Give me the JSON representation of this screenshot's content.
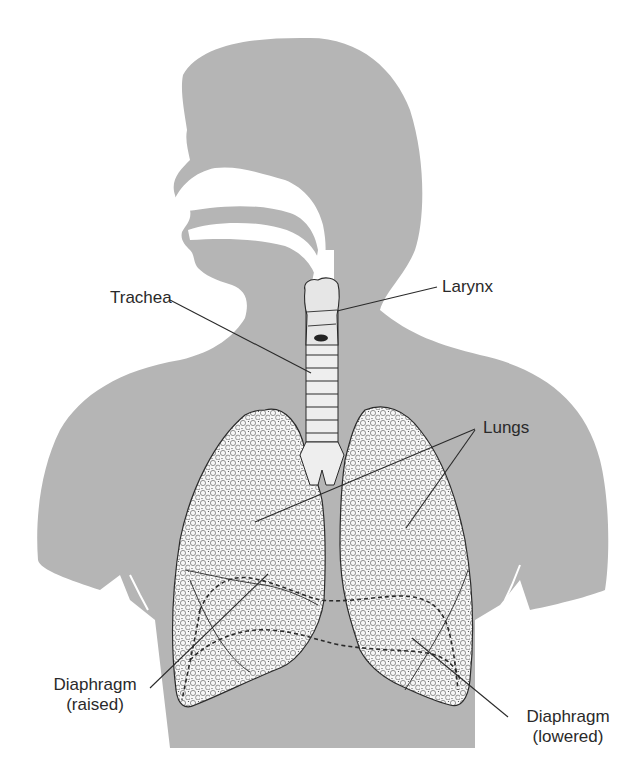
{
  "figure": {
    "colors": {
      "background": "#ffffff",
      "silhouette": "#b5b5b5",
      "lung_fill": "#f4f4f4",
      "line": "#2a2a2a",
      "text": "#2a2a2a"
    }
  },
  "labels": {
    "trachea": "Trachea",
    "larynx": "Larynx",
    "lungs": "Lungs",
    "diaphragm_raised_line1": "Diaphragm",
    "diaphragm_raised_line2": "(raised)",
    "diaphragm_lowered_line1": "Diaphragm",
    "diaphragm_lowered_line2": "(lowered)"
  }
}
